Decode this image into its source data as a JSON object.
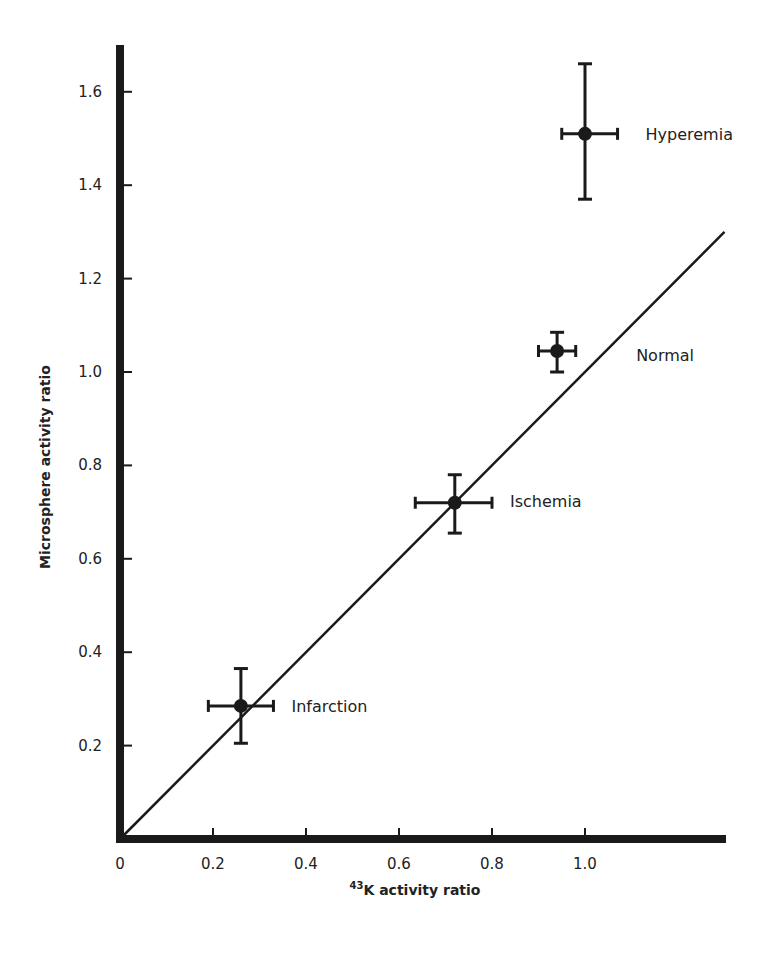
{
  "chart_data": {
    "type": "scatter",
    "title": "",
    "xlabel": "43K activity ratio",
    "xlabel_superscript": "43",
    "xlabel_main": "K activity ratio",
    "ylabel": "Microsphere activity ratio",
    "xlim": [
      0,
      1.3
    ],
    "ylim": [
      0,
      1.7
    ],
    "x_ticks": [
      0,
      0.2,
      0.4,
      0.6,
      0.8,
      1.0
    ],
    "x_tick_labels": [
      "0",
      "0.2",
      "0.4",
      "0.6",
      "0.8",
      "1.0"
    ],
    "y_ticks": [
      0.2,
      0.4,
      0.6,
      0.8,
      1.0,
      1.2,
      1.4,
      1.6
    ],
    "y_tick_labels": [
      "0.2",
      "0.4",
      "0.6",
      "0.8",
      "1.0",
      "1.2",
      "1.4",
      "1.6"
    ],
    "grid": false,
    "legend": null,
    "reference_line": {
      "label": "identity line (y = x)",
      "x": [
        0,
        1.3
      ],
      "y": [
        0,
        1.3
      ]
    },
    "points": [
      {
        "label": "Infarction",
        "x": 0.26,
        "y": 0.285,
        "x_err": [
          0.19,
          0.33
        ],
        "y_err": [
          0.205,
          0.365
        ]
      },
      {
        "label": "Ischemia",
        "x": 0.72,
        "y": 0.72,
        "x_err": [
          0.635,
          0.8
        ],
        "y_err": [
          0.655,
          0.78
        ]
      },
      {
        "label": "Normal",
        "x": 0.94,
        "y": 1.045,
        "x_err": [
          0.9,
          0.98
        ],
        "y_err": [
          1.0,
          1.085
        ]
      },
      {
        "label": "Hyperemia",
        "x": 1.0,
        "y": 1.51,
        "x_err": [
          0.95,
          1.07
        ],
        "y_err": [
          1.37,
          1.66
        ]
      }
    ],
    "annotations": [
      "Hyperemia",
      "Normal",
      "Ischemia",
      "Infarction"
    ]
  },
  "colors": {
    "ink": "#1a1a1a",
    "background": "#ffffff"
  }
}
